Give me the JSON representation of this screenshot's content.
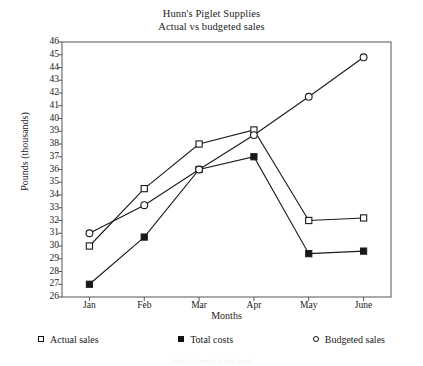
{
  "figure": {
    "title_line1": "Hunn's Piglet Supplies",
    "title_line2": "Actual vs budgeted sales",
    "caption": "Figure  Example of line graph"
  },
  "axes": {
    "ylabel": "Pounds (thousands)",
    "xlabel": "Months"
  },
  "legend": {
    "items": [
      {
        "label": "Actual sales",
        "marker": "open-square"
      },
      {
        "label": "Total costs",
        "marker": "filled-square"
      },
      {
        "label": "Budgeted sales",
        "marker": "open-circle"
      }
    ]
  },
  "chart_data": {
    "type": "line",
    "xlabel": "Months",
    "ylabel": "Pounds (thousands)",
    "categories": [
      "Jan",
      "Feb",
      "Mar",
      "Apr",
      "May",
      "June"
    ],
    "ylim": [
      26,
      46
    ],
    "ytick_step": 1,
    "yticks": [
      26,
      27,
      28,
      29,
      30,
      31,
      32,
      33,
      34,
      35,
      36,
      37,
      38,
      39,
      40,
      41,
      42,
      43,
      44,
      45,
      46
    ],
    "grid": false,
    "legend_position": "below-axes",
    "series": [
      {
        "name": "Actual sales",
        "marker": "open-square",
        "values": [
          30,
          34.5,
          38,
          39.1,
          32,
          32.2
        ]
      },
      {
        "name": "Total costs",
        "marker": "filled-square",
        "values": [
          27,
          30.7,
          36,
          37,
          29.4,
          29.6
        ]
      },
      {
        "name": "Budgeted sales",
        "marker": "open-circle",
        "values": [
          31,
          33.2,
          36,
          38.7,
          41.7,
          44.8
        ]
      }
    ]
  },
  "colors": {
    "line": "#1a1a1a",
    "frame": "#555555",
    "background": "#ffffff"
  }
}
